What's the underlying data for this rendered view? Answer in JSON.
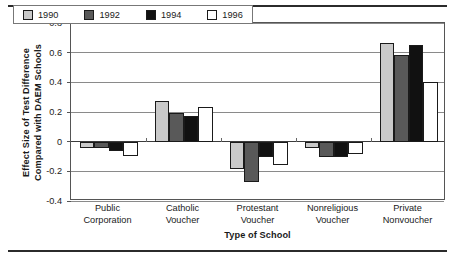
{
  "chart_data": {
    "type": "bar",
    "title": "",
    "xlabel": "Type of School",
    "ylabel_lines": [
      "Effect Size of Test Difference",
      "Compared with DAEM Schools"
    ],
    "ylabel": "Effect Size of Test Difference Compared with DAEM Schools",
    "categories": [
      "Public Corporation",
      "Catholic Voucher",
      "Protestant Voucher",
      "Nonreligious Voucher",
      "Private Nonvoucher"
    ],
    "category_lines": [
      [
        "Public",
        "Corporation"
      ],
      [
        "Catholic",
        "Voucher"
      ],
      [
        "Protestant",
        "Voucher"
      ],
      [
        "Nonreligious",
        "Voucher"
      ],
      [
        "Private",
        "Nonvoucher"
      ]
    ],
    "series": [
      {
        "name": "1990",
        "color": "#c9c9c9",
        "values": [
          -0.04,
          0.275,
          -0.185,
          -0.045,
          0.665
        ]
      },
      {
        "name": "1992",
        "color": "#595959",
        "values": [
          -0.045,
          0.195,
          -0.27,
          -0.105,
          0.585
        ]
      },
      {
        "name": "1994",
        "color": "#111111",
        "values": [
          -0.065,
          0.17,
          -0.105,
          -0.105,
          0.65
        ]
      },
      {
        "name": "1996",
        "color": "#ffffff",
        "values": [
          -0.095,
          0.235,
          -0.155,
          -0.085,
          0.4
        ]
      }
    ],
    "ylim": [
      -0.4,
      0.8
    ],
    "yticks": [
      0.8,
      0.6,
      0.4,
      0.2,
      0,
      -0.2,
      -0.4
    ],
    "ytick_labels": [
      "0.8",
      "0.6",
      "0.4",
      "0.2",
      "0",
      "-0.2",
      "-0.4"
    ],
    "grid": true,
    "legend_position": "top-left-inside",
    "bar_outline_color": "#1a1a1a"
  },
  "legend": {
    "entries": [
      {
        "label": "1990",
        "color": "#c9c9c9"
      },
      {
        "label": "1992",
        "color": "#595959"
      },
      {
        "label": "1994",
        "color": "#111111"
      },
      {
        "label": "1996",
        "color": "#ffffff"
      }
    ]
  }
}
